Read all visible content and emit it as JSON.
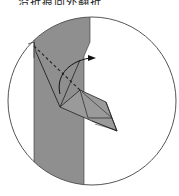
{
  "caption": {
    "text": "沿折痕向外翻折"
  },
  "diagram": {
    "type": "origami-fold-step",
    "colors": {
      "paper_back": "#8f8f8f",
      "paper_front": "#ffffff",
      "outline": "#333333",
      "circle": "#555555"
    },
    "elements": [
      "circle-frame",
      "gray-paper-band",
      "valley-fold-line",
      "fold-arrow",
      "folded-flap"
    ]
  }
}
